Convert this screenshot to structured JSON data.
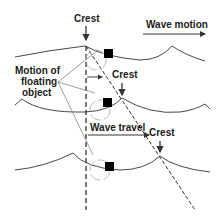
{
  "diagram": {
    "labels": {
      "crest_top": "Crest",
      "wave_motion": "Wave motion",
      "crest_mid": "Crest",
      "motion_line1": "Motion of",
      "motion_line2": "floating",
      "motion_line3": "object",
      "wave_travel": "Wave travel",
      "crest_bottom": "Crest"
    },
    "colors": {
      "line": "#333333",
      "orbit": "#bbbbbb",
      "object": "#000000",
      "background": "#ffffff"
    },
    "wave_profiles": 3,
    "floating_objects": 3
  }
}
